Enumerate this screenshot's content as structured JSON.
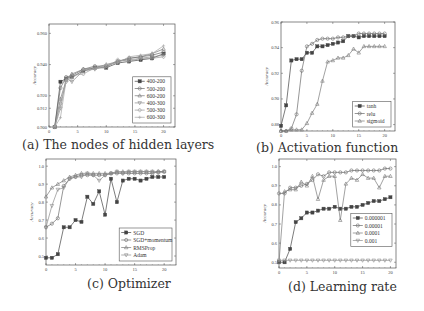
{
  "figure": {
    "captions": {
      "a": "(a) The nodes of hidden layers",
      "b": "(b) Activation function",
      "c": "(c) Optimizer",
      "d": "(d) Learning rate"
    }
  },
  "chart_data": [
    {
      "id": "a",
      "type": "line",
      "title": "(a) The nodes of hidden layers",
      "xlabel": "",
      "ylabel": "Accuracy",
      "xlim": [
        0,
        22
      ],
      "ylim": [
        0.9,
        0.966
      ],
      "xticks": [
        0,
        5,
        10,
        15,
        20
      ],
      "yticks": [
        0.9,
        0.912,
        0.92,
        0.94,
        0.96
      ],
      "ytick_labels": [
        "0.900",
        "0.912",
        "0.920",
        "0.940",
        "0.960"
      ],
      "legend_position": "lower right",
      "x": [
        1,
        2,
        3,
        4,
        6,
        8,
        10,
        12,
        14,
        16,
        18,
        20
      ],
      "series": [
        {
          "name": "400-200",
          "marker": "square",
          "values": [
            0.9,
            0.929,
            0.931,
            0.932,
            0.936,
            0.938,
            0.938,
            0.941,
            0.942,
            0.943,
            0.944,
            0.947
          ]
        },
        {
          "name": "500-200",
          "marker": "circle",
          "values": [
            0.9,
            0.925,
            0.932,
            0.933,
            0.937,
            0.939,
            0.939,
            0.942,
            0.944,
            0.945,
            0.946,
            0.948
          ]
        },
        {
          "name": "600-200",
          "marker": "triangle",
          "values": [
            0.9,
            0.918,
            0.93,
            0.934,
            0.937,
            0.938,
            0.94,
            0.942,
            0.944,
            0.945,
            0.947,
            0.95
          ]
        },
        {
          "name": "400-300",
          "marker": "triangle-down",
          "values": [
            0.9,
            0.912,
            0.931,
            0.929,
            0.936,
            0.937,
            0.939,
            0.942,
            0.943,
            0.944,
            0.945,
            0.946
          ]
        },
        {
          "name": "500-300",
          "marker": "diamond",
          "values": [
            0.9,
            0.915,
            0.929,
            0.933,
            0.934,
            0.938,
            0.938,
            0.943,
            0.942,
            0.944,
            0.944,
            0.945
          ]
        },
        {
          "name": "600-300",
          "marker": "plus",
          "values": [
            0.9,
            0.906,
            0.93,
            0.931,
            0.937,
            0.937,
            0.94,
            0.941,
            0.945,
            0.946,
            0.947,
            0.952
          ]
        }
      ]
    },
    {
      "id": "b",
      "type": "line",
      "title": "(b) Activation function",
      "xlabel": "",
      "ylabel": "Accuracy",
      "xlim": [
        0,
        22
      ],
      "ylim": [
        0.875,
        0.96
      ],
      "xticks": [
        0,
        5,
        10,
        15,
        20
      ],
      "yticks": [
        0.88,
        0.9,
        0.92,
        0.94,
        0.96
      ],
      "ytick_labels": [
        "0.88",
        "0.90",
        "0.92",
        "0.94",
        "0.96"
      ],
      "legend_position": "lower right",
      "x": [
        0,
        1,
        2,
        3,
        4,
        5,
        6,
        7,
        8,
        9,
        10,
        11,
        12,
        13,
        14,
        15,
        16,
        17,
        18,
        19,
        20
      ],
      "series": [
        {
          "name": "tanh",
          "marker": "square",
          "values": [
            0.879,
            0.895,
            0.93,
            0.931,
            0.931,
            0.936,
            0.936,
            0.941,
            0.941,
            0.942,
            0.943,
            0.944,
            0.945,
            0.949,
            0.949,
            0.948,
            0.949,
            0.949,
            0.949,
            0.949,
            0.949
          ]
        },
        {
          "name": "relu",
          "marker": "circle",
          "values": [
            0.875,
            0.875,
            0.877,
            0.888,
            0.922,
            0.941,
            0.943,
            0.946,
            0.947,
            0.947,
            0.947,
            0.948,
            0.948,
            0.949,
            0.949,
            0.951,
            0.951,
            0.951,
            0.951,
            0.951,
            0.951
          ]
        },
        {
          "name": "sigmoid",
          "marker": "triangle",
          "values": [
            0.875,
            0.875,
            0.876,
            0.876,
            0.876,
            0.881,
            0.889,
            0.896,
            0.914,
            0.929,
            0.93,
            0.932,
            0.932,
            0.934,
            0.939,
            0.936,
            0.941,
            0.941,
            0.941,
            0.941,
            0.941
          ]
        }
      ]
    },
    {
      "id": "c",
      "type": "line",
      "title": "(c) Optimizer",
      "xlabel": "",
      "ylabel": "Accuracy",
      "xlim": [
        0,
        22
      ],
      "ylim": [
        0.45,
        1.04
      ],
      "xticks": [
        0,
        5,
        10,
        15,
        20
      ],
      "yticks": [
        0.5,
        0.6,
        0.7,
        0.8,
        0.9,
        1.0
      ],
      "ytick_labels": [
        "0.5",
        "0.6",
        "0.7",
        "0.8",
        "0.9",
        "1.0"
      ],
      "legend_position": "lower right",
      "x": [
        0,
        1,
        2,
        3,
        4,
        5,
        6,
        7,
        8,
        9,
        10,
        11,
        12,
        13,
        14,
        15,
        16,
        17,
        18,
        19,
        20
      ],
      "series": [
        {
          "name": "SGD",
          "marker": "square",
          "values": [
            0.49,
            0.49,
            0.51,
            0.66,
            0.66,
            0.7,
            0.69,
            0.83,
            0.79,
            0.86,
            0.73,
            0.93,
            0.8,
            0.92,
            0.93,
            0.93,
            0.92,
            0.93,
            0.94,
            0.94,
            0.94
          ]
        },
        {
          "name": "SGD+momentum",
          "marker": "circle",
          "values": [
            0.66,
            0.68,
            0.71,
            0.89,
            0.93,
            0.94,
            0.95,
            0.95,
            0.95,
            0.95,
            0.95,
            0.96,
            0.96,
            0.96,
            0.96,
            0.96,
            0.96,
            0.96,
            0.96,
            0.97,
            0.97
          ]
        },
        {
          "name": "RMSProp",
          "marker": "triangle",
          "values": [
            0.83,
            0.88,
            0.9,
            0.92,
            0.94,
            0.95,
            0.96,
            0.96,
            0.96,
            0.96,
            0.96,
            0.96,
            0.97,
            0.97,
            0.97,
            0.97,
            0.97,
            0.97,
            0.97,
            0.97,
            0.97
          ]
        },
        {
          "name": "Adam",
          "marker": "triangle-down",
          "values": [
            0.66,
            0.78,
            0.87,
            0.88,
            0.93,
            0.94,
            0.94,
            0.96,
            0.95,
            0.92,
            0.95,
            0.96,
            0.97,
            0.96,
            0.97,
            0.97,
            0.97,
            0.97,
            0.97,
            0.96,
            0.97
          ]
        }
      ]
    },
    {
      "id": "d",
      "type": "line",
      "title": "(d) Learning rate",
      "xlabel": "",
      "ylabel": "Accuracy",
      "xlim": [
        0,
        21
      ],
      "ylim": [
        0.47,
        1.04
      ],
      "xticks": [
        0,
        5,
        10,
        15,
        20
      ],
      "yticks": [
        0.5,
        0.6,
        0.7,
        0.8,
        0.9,
        1.0
      ],
      "ytick_labels": [
        "0.5",
        "0.6",
        "0.7",
        "0.8",
        "0.9",
        "1.0"
      ],
      "legend_position": "center right",
      "x": [
        0,
        1,
        2,
        3,
        4,
        5,
        6,
        7,
        8,
        9,
        10,
        11,
        12,
        13,
        14,
        15,
        16,
        17,
        18,
        19,
        20
      ],
      "series": [
        {
          "name": "0.000001",
          "marker": "square",
          "values": [
            0.5,
            0.5,
            0.57,
            0.71,
            0.73,
            0.76,
            0.76,
            0.77,
            0.78,
            0.78,
            0.79,
            0.78,
            0.78,
            0.79,
            0.79,
            0.8,
            0.81,
            0.82,
            0.82,
            0.83,
            0.84
          ]
        },
        {
          "name": "0.00001",
          "marker": "circle",
          "values": [
            0.86,
            0.86,
            0.89,
            0.89,
            0.9,
            0.91,
            0.93,
            0.96,
            0.95,
            0.97,
            0.97,
            0.97,
            0.97,
            0.98,
            0.98,
            0.98,
            0.98,
            0.98,
            0.98,
            0.99,
            0.99
          ]
        },
        {
          "name": "0.0001",
          "marker": "triangle",
          "values": [
            0.5,
            0.87,
            0.88,
            0.88,
            0.92,
            0.9,
            0.95,
            0.83,
            0.93,
            0.95,
            0.95,
            0.72,
            0.91,
            0.94,
            0.93,
            0.96,
            0.94,
            0.94,
            0.89,
            0.95,
            0.95
          ]
        },
        {
          "name": "0.001",
          "marker": "triangle-down",
          "values": [
            0.51,
            0.51,
            0.51,
            0.51,
            0.51,
            0.51,
            0.51,
            0.51,
            0.51,
            0.51,
            0.51,
            0.51,
            0.51,
            0.51,
            0.51,
            0.51,
            0.51,
            0.51,
            0.51,
            0.51,
            0.51
          ]
        }
      ]
    }
  ]
}
